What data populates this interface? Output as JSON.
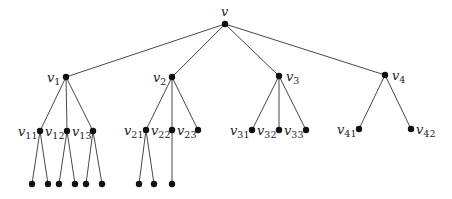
{
  "diagram": {
    "type": "rooted-tree",
    "colors": {
      "edge": "#333333",
      "node": "#111111",
      "label": "#222222"
    },
    "nodes": [
      {
        "id": "v",
        "label": "v",
        "sub": "",
        "x": 225,
        "y": 24,
        "lx": 221,
        "ly": 16,
        "anchor": "start"
      },
      {
        "id": "v1",
        "label": "v",
        "sub": "1",
        "x": 66,
        "y": 77,
        "lx": 47,
        "ly": 82,
        "anchor": "start"
      },
      {
        "id": "v2",
        "label": "v",
        "sub": "2",
        "x": 172,
        "y": 77,
        "lx": 153,
        "ly": 82,
        "anchor": "start"
      },
      {
        "id": "v3",
        "label": "v",
        "sub": "3",
        "x": 279,
        "y": 76,
        "lx": 286,
        "ly": 81,
        "anchor": "start"
      },
      {
        "id": "v4",
        "label": "v",
        "sub": "4",
        "x": 385,
        "y": 75,
        "lx": 392,
        "ly": 80,
        "anchor": "start"
      },
      {
        "id": "v11",
        "label": "v",
        "sub": "11",
        "x": 40,
        "y": 131,
        "lx": 18,
        "ly": 136,
        "anchor": "start"
      },
      {
        "id": "v12",
        "label": "v",
        "sub": "12",
        "x": 67,
        "y": 131,
        "lx": 45,
        "ly": 136,
        "anchor": "start"
      },
      {
        "id": "v13",
        "label": "v",
        "sub": "13",
        "x": 93,
        "y": 131,
        "lx": 72,
        "ly": 136,
        "anchor": "start"
      },
      {
        "id": "v21",
        "label": "v",
        "sub": "21",
        "x": 146,
        "y": 130,
        "lx": 124,
        "ly": 135,
        "anchor": "start"
      },
      {
        "id": "v22",
        "label": "v",
        "sub": "22",
        "x": 172,
        "y": 130,
        "lx": 151,
        "ly": 135,
        "anchor": "start"
      },
      {
        "id": "v23",
        "label": "v",
        "sub": "23",
        "x": 198,
        "y": 130,
        "lx": 177,
        "ly": 135,
        "anchor": "start"
      },
      {
        "id": "v31",
        "label": "v",
        "sub": "31",
        "x": 252,
        "y": 130,
        "lx": 230,
        "ly": 135,
        "anchor": "start"
      },
      {
        "id": "v32",
        "label": "v",
        "sub": "32",
        "x": 279,
        "y": 130,
        "lx": 257,
        "ly": 135,
        "anchor": "start"
      },
      {
        "id": "v33",
        "label": "v",
        "sub": "33",
        "x": 306,
        "y": 130,
        "lx": 284,
        "ly": 135,
        "anchor": "start"
      },
      {
        "id": "v41",
        "label": "v",
        "sub": "41",
        "x": 359,
        "y": 129,
        "lx": 337,
        "ly": 134,
        "anchor": "start"
      },
      {
        "id": "v42",
        "label": "v",
        "sub": "42",
        "x": 411,
        "y": 129,
        "lx": 416,
        "ly": 134,
        "anchor": "start"
      },
      {
        "id": "l111",
        "label": "",
        "sub": "",
        "x": 32,
        "y": 184
      },
      {
        "id": "l112",
        "label": "",
        "sub": "",
        "x": 48,
        "y": 184
      },
      {
        "id": "l121",
        "label": "",
        "sub": "",
        "x": 59,
        "y": 184
      },
      {
        "id": "l122",
        "label": "",
        "sub": "",
        "x": 75,
        "y": 184
      },
      {
        "id": "l131",
        "label": "",
        "sub": "",
        "x": 86,
        "y": 184
      },
      {
        "id": "l132",
        "label": "",
        "sub": "",
        "x": 102,
        "y": 184
      },
      {
        "id": "l211",
        "label": "",
        "sub": "",
        "x": 139,
        "y": 184
      },
      {
        "id": "l212",
        "label": "",
        "sub": "",
        "x": 154,
        "y": 184
      },
      {
        "id": "l221",
        "label": "",
        "sub": "",
        "x": 172,
        "y": 184
      }
    ],
    "edges": [
      [
        "v",
        "v1"
      ],
      [
        "v",
        "v2"
      ],
      [
        "v",
        "v3"
      ],
      [
        "v",
        "v4"
      ],
      [
        "v1",
        "v11"
      ],
      [
        "v1",
        "v12"
      ],
      [
        "v1",
        "v13"
      ],
      [
        "v2",
        "v21"
      ],
      [
        "v2",
        "v22"
      ],
      [
        "v2",
        "v23"
      ],
      [
        "v3",
        "v31"
      ],
      [
        "v3",
        "v32"
      ],
      [
        "v3",
        "v33"
      ],
      [
        "v4",
        "v41"
      ],
      [
        "v4",
        "v42"
      ],
      [
        "v11",
        "l111"
      ],
      [
        "v11",
        "l112"
      ],
      [
        "v12",
        "l121"
      ],
      [
        "v12",
        "l122"
      ],
      [
        "v13",
        "l131"
      ],
      [
        "v13",
        "l132"
      ],
      [
        "v21",
        "l211"
      ],
      [
        "v21",
        "l212"
      ],
      [
        "v22",
        "l221"
      ]
    ]
  }
}
